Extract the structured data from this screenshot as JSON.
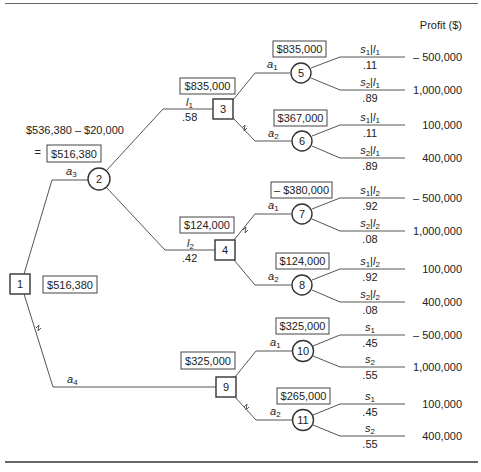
{
  "header": {
    "profit_label": "Profit ($)"
  },
  "root": {
    "node": "1",
    "value": "$516,380",
    "a3_computation_line1": "$536,380 – $20,000",
    "a3_computation_eq": "=",
    "a3_value": "$516,380"
  },
  "branches": {
    "a3": {
      "label": "a",
      "sub": "3"
    },
    "a4": {
      "label": "a",
      "sub": "4"
    }
  },
  "node2": {
    "id": "2"
  },
  "node3": {
    "id": "3",
    "value": "$835,000",
    "in_label": "l",
    "in_sub": "1",
    "in_prob": ".58",
    "a1": {
      "label": "a",
      "sub": "1",
      "node": "5",
      "value": "$835,000",
      "outcomes": [
        {
          "s": "s",
          "ssub": "1",
          "l": "l",
          "lsub": "1",
          "prob": ".11",
          "profit": "– 500,000"
        },
        {
          "s": "s",
          "ssub": "2",
          "l": "l",
          "lsub": "1",
          "prob": ".89",
          "profit": "1,000,000"
        }
      ]
    },
    "a2": {
      "label": "a",
      "sub": "2",
      "node": "6",
      "value": "$367,000",
      "outcomes": [
        {
          "s": "s",
          "ssub": "1",
          "l": "l",
          "lsub": "1",
          "prob": ".11",
          "profit": "100,000"
        },
        {
          "s": "s",
          "ssub": "2",
          "l": "l",
          "lsub": "1",
          "prob": ".89",
          "profit": "400,000"
        }
      ]
    }
  },
  "node4": {
    "id": "4",
    "value": "$124,000",
    "in_label": "l",
    "in_sub": "2",
    "in_prob": ".42",
    "a1": {
      "label": "a",
      "sub": "1",
      "node": "7",
      "value": "– $380,000",
      "outcomes": [
        {
          "s": "s",
          "ssub": "1",
          "l": "l",
          "lsub": "2",
          "prob": ".92",
          "profit": "– 500,000"
        },
        {
          "s": "s",
          "ssub": "2",
          "l": "l",
          "lsub": "2",
          "prob": ".08",
          "profit": "1,000,000"
        }
      ]
    },
    "a2": {
      "label": "a",
      "sub": "2",
      "node": "8",
      "value": "$124,000",
      "outcomes": [
        {
          "s": "s",
          "ssub": "1",
          "l": "l",
          "lsub": "2",
          "prob": ".92",
          "profit": "100,000"
        },
        {
          "s": "s",
          "ssub": "2",
          "l": "l",
          "lsub": "2",
          "prob": ".08",
          "profit": "400,000"
        }
      ]
    }
  },
  "node9": {
    "id": "9",
    "value": "$325,000",
    "a1": {
      "label": "a",
      "sub": "1",
      "node": "10",
      "value": "$325,000",
      "outcomes": [
        {
          "s": "s",
          "ssub": "1",
          "prob": ".45",
          "profit": "– 500,000"
        },
        {
          "s": "s",
          "ssub": "2",
          "prob": ".55",
          "profit": "1,000,000"
        }
      ]
    },
    "a2": {
      "label": "a",
      "sub": "2",
      "node": "11",
      "value": "$265,000",
      "outcomes": [
        {
          "s": "s",
          "ssub": "1",
          "prob": ".45",
          "profit": "100,000"
        },
        {
          "s": "s",
          "ssub": "2",
          "prob": ".55",
          "profit": "400,000"
        }
      ]
    }
  },
  "colors": {
    "line": "#555555",
    "text": "#222222",
    "background": "#ffffff"
  }
}
